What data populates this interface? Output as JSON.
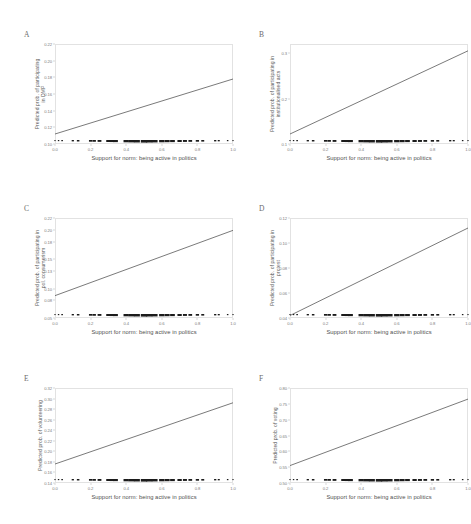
{
  "figure": {
    "background": "#ffffff",
    "line_color": "#4d4d4d",
    "frame_color": "#e2e2e2",
    "rug_color": "#1b1b1b",
    "shared_xlabel": "Support for norm: being active in politics"
  },
  "chart_data": [
    {
      "type": "line",
      "panel": "A",
      "title": "",
      "xlabel": "Support for norm: being active in politics",
      "ylabel": "Predicted prob. of participating in DMP",
      "ylabel_lines": [
        "Predicted prob. of participating",
        "in DMP"
      ],
      "x": [
        0.0,
        1.0
      ],
      "values": [
        0.112,
        0.178
      ],
      "xlim": [
        0.0,
        1.0
      ],
      "ylim": [
        0.1,
        0.22
      ],
      "xticks": [
        0.0,
        0.2,
        0.4,
        0.6,
        0.8,
        1.0
      ],
      "xticklabels": [
        "0.0",
        "0.2",
        "0.4",
        "0.6",
        "0.8",
        "1.0"
      ],
      "yticks": [
        0.1,
        0.12,
        0.14,
        0.16,
        0.18,
        0.2,
        0.22
      ],
      "yticklabels": [
        "0.10",
        "0.12",
        "0.14",
        "0.16",
        "0.18",
        "0.20",
        "0.22"
      ],
      "grid": false,
      "legend": "none",
      "rug": [
        0.0,
        0.02,
        0.04,
        0.1,
        0.13,
        0.2,
        0.22,
        0.25,
        0.3,
        0.32,
        0.34,
        0.4,
        0.43,
        0.46,
        0.5,
        0.53,
        0.56,
        0.6,
        0.63,
        0.66,
        0.7,
        0.73,
        0.76,
        0.8,
        0.83,
        0.9,
        0.92,
        0.97,
        1.0
      ]
    },
    {
      "type": "line",
      "panel": "B",
      "title": "",
      "xlabel": "Support for norm: being active in politics",
      "ylabel": "Predicted prob. of participating in institutionalised acts",
      "ylabel_lines": [
        "Predicted prob. of participating in",
        "institutionalised acts"
      ],
      "x": [
        0.0,
        1.0
      ],
      "values": [
        0.122,
        0.305
      ],
      "xlim": [
        0.0,
        1.0
      ],
      "ylim": [
        0.1,
        0.32
      ],
      "xticks": [
        0.0,
        0.2,
        0.4,
        0.6,
        0.8,
        1.0
      ],
      "xticklabels": [
        "0.0",
        "0.2",
        "0.4",
        "0.6",
        "0.8",
        "1.0"
      ],
      "yticks": [
        0.1,
        0.2,
        0.3
      ],
      "yticklabels": [
        "0.1",
        "0.2",
        "0.3"
      ],
      "grid": false,
      "legend": "none",
      "rug": [
        0.0,
        0.02,
        0.04,
        0.1,
        0.13,
        0.2,
        0.22,
        0.25,
        0.3,
        0.32,
        0.34,
        0.4,
        0.43,
        0.46,
        0.5,
        0.53,
        0.56,
        0.6,
        0.63,
        0.66,
        0.7,
        0.73,
        0.76,
        0.8,
        0.83,
        0.9,
        0.92,
        0.97,
        1.0
      ]
    },
    {
      "type": "line",
      "panel": "C",
      "title": "",
      "xlabel": "Support for norm: being active in politics",
      "ylabel": "Predicted prob. of participating in pol. consumerism",
      "ylabel_lines": [
        "Predicted prob. of participating in",
        "pol. consumerism"
      ],
      "x": [
        0.0,
        1.0
      ],
      "values": [
        0.088,
        0.199
      ],
      "xlim": [
        0.0,
        1.0
      ],
      "ylim": [
        0.05,
        0.22
      ],
      "xticks": [
        0.0,
        0.2,
        0.4,
        0.6,
        0.8,
        1.0
      ],
      "xticklabels": [
        "0.0",
        "0.2",
        "0.4",
        "0.6",
        "0.8",
        "1.0"
      ],
      "yticks": [
        0.05,
        0.08,
        0.1,
        0.13,
        0.15,
        0.18,
        0.2,
        0.22
      ],
      "yticklabels": [
        "0.05",
        "0.08",
        "0.10",
        "0.13",
        "0.15",
        "0.18",
        "0.20",
        "0.22"
      ],
      "grid": false,
      "legend": "none",
      "rug": [
        0.0,
        0.02,
        0.04,
        0.1,
        0.13,
        0.2,
        0.22,
        0.25,
        0.3,
        0.32,
        0.34,
        0.4,
        0.43,
        0.46,
        0.5,
        0.53,
        0.56,
        0.6,
        0.63,
        0.66,
        0.7,
        0.73,
        0.76,
        0.8,
        0.83,
        0.9,
        0.92,
        0.97,
        1.0
      ]
    },
    {
      "type": "line",
      "panel": "D",
      "title": "",
      "xlabel": "Support for norm: being active in politics",
      "ylabel": "Predicted prob. of participating in protest",
      "ylabel_lines": [
        "Predicted prob. of participating in",
        "protest"
      ],
      "x": [
        0.0,
        1.0
      ],
      "values": [
        0.042,
        0.112
      ],
      "xlim": [
        0.0,
        1.0
      ],
      "ylim": [
        0.04,
        0.12
      ],
      "xticks": [
        0.0,
        0.2,
        0.4,
        0.6,
        0.8,
        1.0
      ],
      "xticklabels": [
        "0.0",
        "0.2",
        "0.4",
        "0.6",
        "0.8",
        "1.0"
      ],
      "yticks": [
        0.04,
        0.06,
        0.08,
        0.1,
        0.12
      ],
      "yticklabels": [
        "0.04",
        "0.06",
        "0.08",
        "0.10",
        "0.12"
      ],
      "grid": false,
      "legend": "none",
      "rug": [
        0.0,
        0.02,
        0.04,
        0.1,
        0.13,
        0.2,
        0.22,
        0.25,
        0.3,
        0.32,
        0.34,
        0.4,
        0.43,
        0.46,
        0.5,
        0.53,
        0.56,
        0.6,
        0.63,
        0.66,
        0.7,
        0.73,
        0.76,
        0.8,
        0.83,
        0.9,
        0.92,
        0.97,
        1.0
      ]
    },
    {
      "type": "line",
      "panel": "E",
      "title": "",
      "xlabel": "Support for norm: being active in politics",
      "ylabel": "Predicted prob. of volunteering",
      "ylabel_lines": [
        "Predicted prob. of volunteering"
      ],
      "x": [
        0.0,
        1.0
      ],
      "values": [
        0.176,
        0.292
      ],
      "xlim": [
        0.0,
        1.0
      ],
      "ylim": [
        0.14,
        0.32
      ],
      "xticks": [
        0.0,
        0.2,
        0.4,
        0.6,
        0.8,
        1.0
      ],
      "xticklabels": [
        "0.0",
        "0.2",
        "0.4",
        "0.6",
        "0.8",
        "1.0"
      ],
      "yticks": [
        0.14,
        0.16,
        0.18,
        0.2,
        0.22,
        0.24,
        0.26,
        0.28,
        0.3,
        0.32
      ],
      "yticklabels": [
        "0.14",
        "0.16",
        "0.18",
        "0.20",
        "0.22",
        "0.24",
        "0.26",
        "0.28",
        "0.30",
        "0.32"
      ],
      "grid": false,
      "legend": "none",
      "rug": [
        0.0,
        0.02,
        0.04,
        0.1,
        0.13,
        0.2,
        0.22,
        0.25,
        0.3,
        0.32,
        0.34,
        0.4,
        0.43,
        0.46,
        0.5,
        0.53,
        0.56,
        0.6,
        0.63,
        0.66,
        0.7,
        0.73,
        0.76,
        0.8,
        0.83,
        0.9,
        0.92,
        0.97,
        1.0
      ]
    },
    {
      "type": "line",
      "panel": "F",
      "title": "",
      "xlabel": "Support for norm: being active in politics",
      "ylabel": "Predicted prob. of voting",
      "ylabel_lines": [
        "Predicted prob. of voting"
      ],
      "x": [
        0.0,
        1.0
      ],
      "values": [
        0.555,
        0.765
      ],
      "xlim": [
        0.0,
        1.0
      ],
      "ylim": [
        0.5,
        0.8
      ],
      "xticks": [
        0.0,
        0.2,
        0.4,
        0.6,
        0.8,
        1.0
      ],
      "xticklabels": [
        "0.0",
        "0.2",
        "0.4",
        "0.6",
        "0.8",
        "1.0"
      ],
      "yticks": [
        0.5,
        0.55,
        0.6,
        0.65,
        0.7,
        0.75,
        0.8
      ],
      "yticklabels": [
        "0.50",
        "0.55",
        "0.60",
        "0.65",
        "0.70",
        "0.75",
        "0.80"
      ],
      "grid": false,
      "legend": "none",
      "rug": [
        0.0,
        0.02,
        0.04,
        0.1,
        0.13,
        0.2,
        0.22,
        0.25,
        0.3,
        0.32,
        0.34,
        0.4,
        0.43,
        0.46,
        0.5,
        0.53,
        0.56,
        0.6,
        0.63,
        0.66,
        0.7,
        0.73,
        0.76,
        0.8,
        0.83,
        0.9,
        0.92,
        0.97,
        1.0
      ]
    }
  ]
}
